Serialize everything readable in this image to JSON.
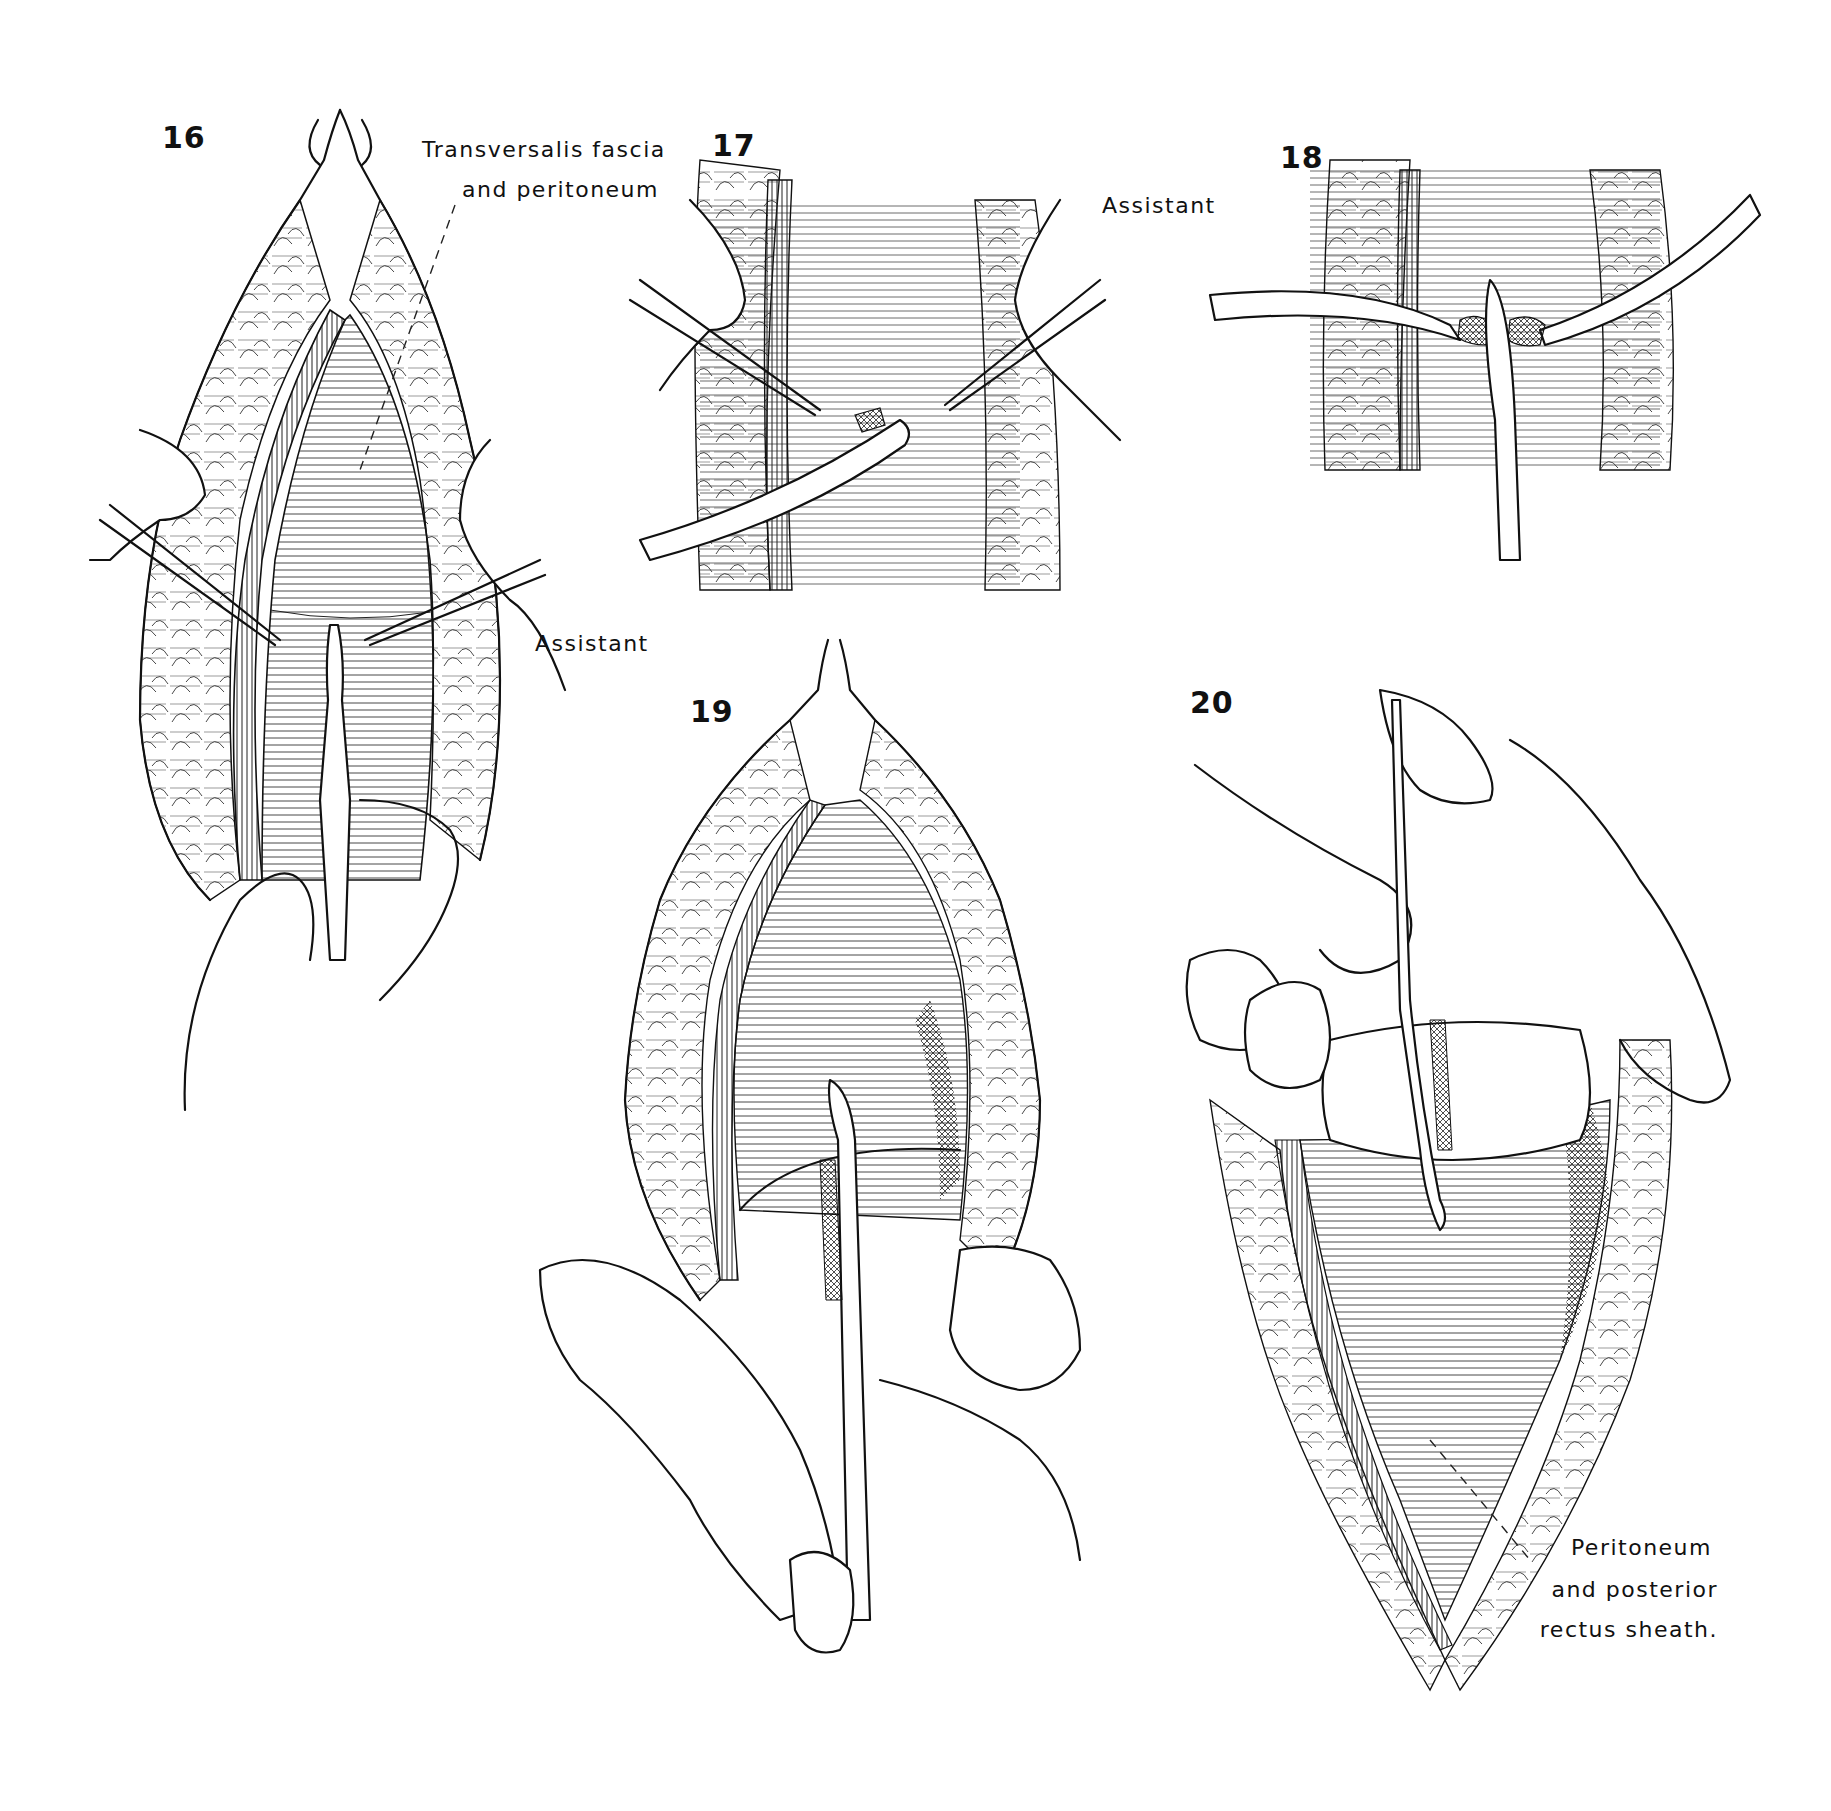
{
  "plate": {
    "figures": [
      {
        "id": "16",
        "number": "16",
        "labels": [
          "Transversalis fascia",
          "and peritoneum",
          "Assistant"
        ]
      },
      {
        "id": "17",
        "number": "17",
        "labels": [
          "Assistant"
        ]
      },
      {
        "id": "18",
        "number": "18",
        "labels": []
      },
      {
        "id": "19",
        "number": "19",
        "labels": []
      },
      {
        "id": "20",
        "number": "20",
        "labels": [
          "Peritoneum",
          "and posterior",
          "rectus sheath."
        ]
      }
    ]
  },
  "fig16": {
    "number": "16",
    "label_fascia_line1": "Transversalis fascia",
    "label_fascia_line2": "and peritoneum",
    "label_assistant": "Assistant"
  },
  "fig17": {
    "number": "17",
    "label_assistant": "Assistant"
  },
  "fig18": {
    "number": "18"
  },
  "fig19": {
    "number": "19"
  },
  "fig20": {
    "number": "20",
    "label_line1": "Peritoneum",
    "label_line2": "and posterior",
    "label_line3": "rectus sheath."
  },
  "icons": {
    "illustration_style": "pen-and-ink line drawing"
  }
}
